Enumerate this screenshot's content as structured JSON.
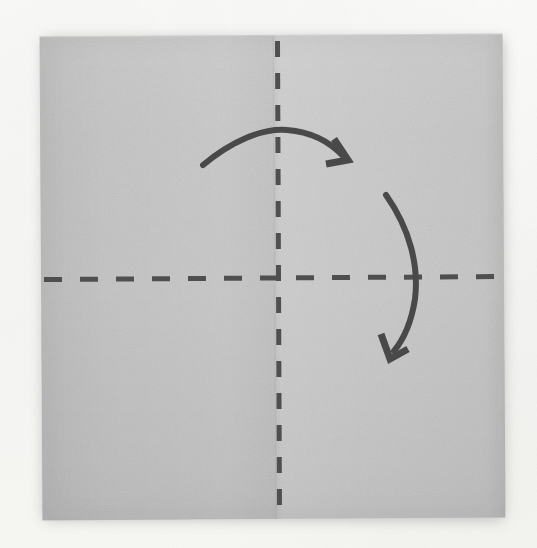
{
  "scene": {
    "title": "Origami fold-step photograph",
    "subject": "square paper sheet with valley-fold guide lines and rotation arrows",
    "background_color": "#f7f7f5",
    "paper_color": "#cacaca",
    "ink_color": "#4a4a4a",
    "canvas": {
      "width": 537,
      "height": 548
    }
  },
  "paper": {
    "name": "square-sheet",
    "left": 41,
    "top": 35,
    "width": 463,
    "height": 484,
    "rotation_deg": -0.35,
    "shadow_color": "rgba(60,60,60,0.30)"
  },
  "fold_lines": [
    {
      "id": "vertical-fold-line",
      "orientation": "vertical",
      "style": "dashed",
      "meaning": "existing crease / fold guide",
      "x": 277,
      "y_start": 41,
      "y_end": 516,
      "stroke_width": 5,
      "dash": 16,
      "gap": 16,
      "color": "#4f4f4f"
    },
    {
      "id": "horizontal-fold-line",
      "orientation": "horizontal",
      "style": "dashed",
      "meaning": "existing crease / fold guide",
      "y": 278,
      "x_start": 44,
      "x_end": 500,
      "stroke_width": 5,
      "dash": 18,
      "gap": 18,
      "color": "#4f4f4f"
    }
  ],
  "arrows": [
    {
      "id": "top-fold-arrow",
      "name": "fold-right-arrow",
      "meaning": "fold the left half over to the right across the vertical crease",
      "direction": "left-to-right, arcing over the top",
      "start": [
        203,
        164
      ],
      "control": [
        275,
        127
      ],
      "end": [
        341,
        155
      ],
      "head_at": [
        341,
        155
      ],
      "head_style": "angular-chevron",
      "stroke_width": 6,
      "color": "#4a4a4a"
    },
    {
      "id": "right-rotate-arrow",
      "name": "fold-down-arrow",
      "meaning": "bring the upper edge down across the horizontal crease",
      "direction": "top-to-bottom, bowing out to the right",
      "start": [
        386,
        195
      ],
      "control": [
        430,
        275
      ],
      "end": [
        393,
        348
      ],
      "head_at": [
        393,
        348
      ],
      "head_style": "angular-chevron",
      "stroke_width": 6,
      "color": "#4a4a4a"
    }
  ]
}
